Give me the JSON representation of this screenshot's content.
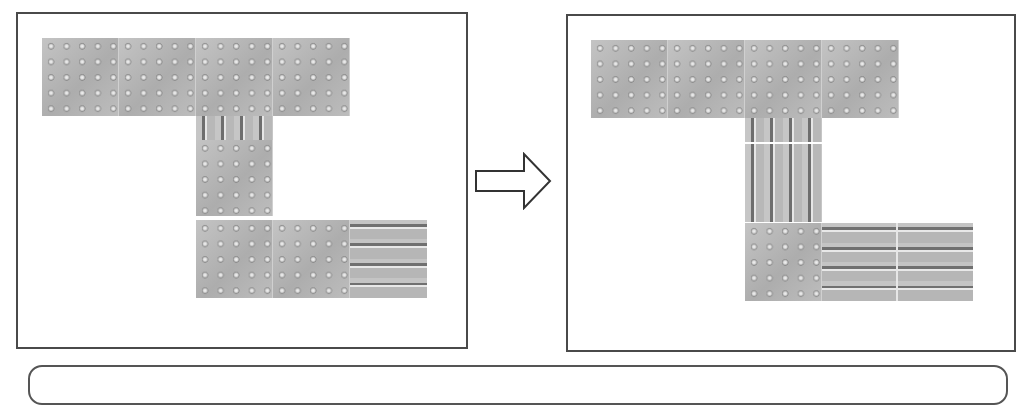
{
  "figure": {
    "colors": {
      "panel_border": "#4a4a4a",
      "tile_base": "#b9b9b9",
      "groove_dark": "#6e6e6e",
      "groove_light": "#e6e6e6",
      "arrow_stroke": "#333333"
    },
    "before_panel": {
      "label": "before-layout",
      "tiles": [
        {
          "type": "dot-warning",
          "row": "top",
          "count": 4
        },
        {
          "type": "line-guidance-vertical-strip",
          "position": "below-top-center",
          "count": 1
        },
        {
          "type": "dot-warning",
          "position": "center-column",
          "count": 1
        },
        {
          "type": "dot-warning",
          "row": "bottom",
          "count": 2
        },
        {
          "type": "line-guidance-horizontal",
          "row": "bottom-right",
          "count": 1
        }
      ]
    },
    "transition_arrow": {
      "icon": "arrow-right-icon"
    },
    "after_panel": {
      "label": "after-layout",
      "tiles": [
        {
          "type": "dot-warning",
          "row": "top",
          "count": 4
        },
        {
          "type": "line-guidance-vertical-strip",
          "position": "below-top-center",
          "count": 1
        },
        {
          "type": "line-guidance-vertical",
          "position": "center-column",
          "count": 1
        },
        {
          "type": "dot-warning",
          "row": "bottom-left",
          "count": 1
        },
        {
          "type": "line-guidance-horizontal",
          "row": "bottom-right",
          "count": 2
        }
      ]
    },
    "caption_box": {
      "text": ""
    }
  }
}
